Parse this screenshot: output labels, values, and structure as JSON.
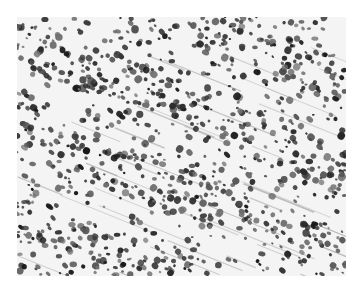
{
  "image": {
    "description": "Grayscale histology micrograph showing densely packed dark cell nuclei arranged in diagonal streaks across pale stroma",
    "background_color": "#ffffff",
    "tissue_background": "#f4f4f4",
    "nucleus_colors": [
      "#1a1a1a",
      "#2b2b2b",
      "#3d3d3d",
      "#555555",
      "#707070"
    ],
    "fiber_color": "#9a9a9a",
    "frame": {
      "x": 17,
      "y": 17,
      "width": 329,
      "height": 259
    },
    "nucleus_count": 1400,
    "fiber_count": 40,
    "streak_angle_deg": 22,
    "seed": 7
  }
}
